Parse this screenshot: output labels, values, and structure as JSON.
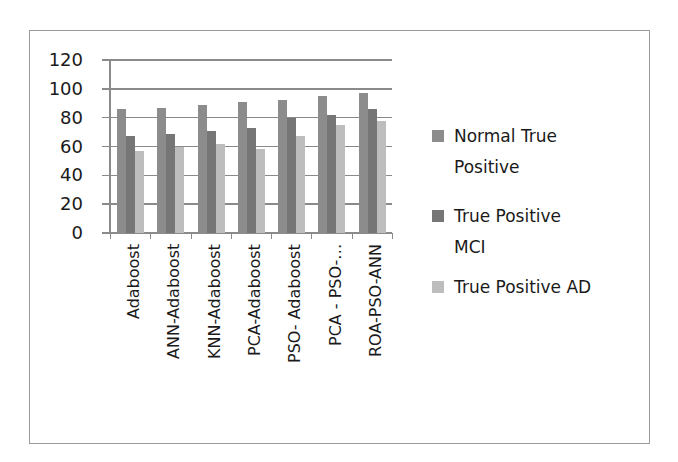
{
  "chart_data": {
    "type": "bar",
    "title": "",
    "xlabel": "",
    "ylabel": "",
    "ylim": [
      0,
      120
    ],
    "yticks": [
      0,
      20,
      40,
      60,
      80,
      100,
      120
    ],
    "grid": true,
    "legend_position": "right",
    "categories": [
      "Adaboost",
      "ANN-Adaboost",
      "KNN-Adaboost",
      "PCA-Adaboost",
      "PSO- Adaboost",
      "PCA - PSO-…",
      "ROA-PSO-ANN"
    ],
    "series": [
      {
        "name": "Normal True Positive",
        "color": "#8c8c8c",
        "values": [
          86,
          87,
          89,
          91,
          92,
          95,
          97
        ]
      },
      {
        "name": "True Positive MCI",
        "color": "#767676",
        "values": [
          67,
          69,
          71,
          73,
          80,
          82,
          86
        ]
      },
      {
        "name": "True Positive AD",
        "color": "#bdbdbd",
        "values": [
          57,
          60,
          62,
          58,
          67,
          75,
          78
        ]
      }
    ]
  },
  "legend": {
    "items": [
      {
        "line1": "Normal True",
        "line2": "Positive"
      },
      {
        "line1": "True Positive",
        "line2": "MCI"
      },
      {
        "line1": "True Positive AD",
        "line2": ""
      }
    ]
  }
}
